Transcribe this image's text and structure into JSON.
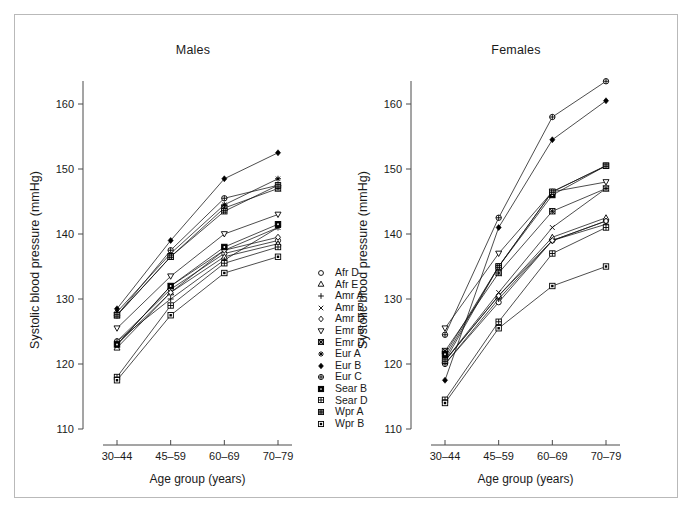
{
  "figure": {
    "border_color": "#b9b9b9",
    "background": "#ffffff",
    "line_color": "#111111"
  },
  "axis": {
    "ylabel": "Systolic blood pressure (mmHg)",
    "xlabel": "Age group (years)",
    "yticks": [
      "110",
      "120",
      "130",
      "140",
      "150",
      "160"
    ],
    "xticks": [
      "30–44",
      "45–59",
      "60–69",
      "70–79"
    ]
  },
  "legend": {
    "entries": [
      {
        "label": "Afr D",
        "symbol": "circle-open"
      },
      {
        "label": "Afr E",
        "symbol": "triangle-open"
      },
      {
        "label": "Amr A",
        "symbol": "plus"
      },
      {
        "label": "Amr B",
        "symbol": "cross"
      },
      {
        "label": "Amr D",
        "symbol": "diamond-open"
      },
      {
        "label": "Emr B",
        "symbol": "triangle-down-open"
      },
      {
        "label": "Emr D",
        "symbol": "square-crosshatch"
      },
      {
        "label": "Eur A",
        "symbol": "asterisk"
      },
      {
        "label": "Eur B",
        "symbol": "diamond-filled"
      },
      {
        "label": "Eur C",
        "symbol": "circle-plus"
      },
      {
        "label": "Sear B",
        "symbol": "square-filled-dot"
      },
      {
        "label": "Sear D",
        "symbol": "square-plus"
      },
      {
        "label": "Wpr A",
        "symbol": "square-hatched"
      },
      {
        "label": "Wpr B",
        "symbol": "square-small-filled"
      }
    ]
  },
  "chart_data": {
    "type": "line",
    "xlabel": "Age group (years)",
    "ylabel": "Systolic blood pressure (mmHg)",
    "categories": [
      "30–44",
      "45–59",
      "60–69",
      "70–79"
    ],
    "ylim": [
      110,
      162
    ],
    "yticks": [
      110,
      120,
      130,
      140,
      150,
      160
    ],
    "grid": false,
    "legend_position": "center",
    "panels": [
      {
        "name": "Males",
        "title": "Males",
        "series": [
          {
            "name": "Afr D",
            "symbol": "circle-open",
            "values": [
              123.5,
              131.5,
              137.0,
              139.0
            ]
          },
          {
            "name": "Afr E",
            "symbol": "triangle-open",
            "values": [
              122.5,
              131.0,
              136.5,
              138.5
            ]
          },
          {
            "name": "Amr A",
            "symbol": "plus",
            "values": [
              123.5,
              130.0,
              136.0,
              141.0
            ]
          },
          {
            "name": "Amr B",
            "symbol": "cross",
            "values": [
              123.0,
              132.0,
              137.5,
              141.0
            ]
          },
          {
            "name": "Amr D",
            "symbol": "diamond-open",
            "values": [
              123.0,
              131.0,
              137.5,
              139.5
            ]
          },
          {
            "name": "Emr B",
            "symbol": "triangle-down-open",
            "values": [
              125.5,
              133.5,
              140.0,
              143.0
            ]
          },
          {
            "name": "Emr D",
            "symbol": "square-crosshatch",
            "values": [
              127.5,
              136.5,
              144.0,
              147.0
            ]
          },
          {
            "name": "Eur A",
            "symbol": "asterisk",
            "values": [
              128.0,
              137.0,
              144.5,
              148.5
            ]
          },
          {
            "name": "Eur B",
            "symbol": "diamond-filled",
            "values": [
              128.5,
              139.0,
              148.5,
              152.5
            ]
          },
          {
            "name": "Eur C",
            "symbol": "circle-plus",
            "values": [
              127.5,
              137.5,
              145.5,
              147.5
            ]
          },
          {
            "name": "Sear B",
            "symbol": "square-filled-dot",
            "values": [
              123.0,
              132.0,
              138.0,
              141.5
            ]
          },
          {
            "name": "Sear D",
            "symbol": "square-plus",
            "values": [
              118.0,
              129.0,
              135.5,
              138.0
            ]
          },
          {
            "name": "Wpr A",
            "symbol": "square-hatched",
            "values": [
              127.5,
              136.5,
              143.5,
              147.5
            ]
          },
          {
            "name": "Wpr B",
            "symbol": "square-small-filled",
            "values": [
              117.5,
              127.5,
              134.0,
              136.5
            ]
          }
        ]
      },
      {
        "name": "Females",
        "title": "Females",
        "series": [
          {
            "name": "Afr D",
            "symbol": "circle-open",
            "values": [
              120.0,
              129.5,
              139.0,
              142.0
            ]
          },
          {
            "name": "Afr E",
            "symbol": "triangle-open",
            "values": [
              120.5,
              130.5,
              139.5,
              142.5
            ]
          },
          {
            "name": "Amr A",
            "symbol": "plus",
            "values": [
              120.0,
              130.0,
              139.0,
              141.5
            ]
          },
          {
            "name": "Amr B",
            "symbol": "cross",
            "values": [
              120.5,
              131.0,
              141.0,
              147.0
            ]
          },
          {
            "name": "Amr D",
            "symbol": "diamond-open",
            "values": [
              120.5,
              130.5,
              139.0,
              142.0
            ]
          },
          {
            "name": "Emr B",
            "symbol": "triangle-down-open",
            "values": [
              125.5,
              137.0,
              146.5,
              148.0
            ]
          },
          {
            "name": "Emr D",
            "symbol": "square-crosshatch",
            "values": [
              122.0,
              134.0,
              143.5,
              147.0
            ]
          },
          {
            "name": "Eur A",
            "symbol": "asterisk",
            "values": [
              121.0,
              135.0,
              146.5,
              150.5
            ]
          },
          {
            "name": "Eur B",
            "symbol": "diamond-filled",
            "values": [
              117.5,
              141.0,
              154.5,
              160.5
            ]
          },
          {
            "name": "Eur C",
            "symbol": "circle-plus",
            "values": [
              124.5,
              142.5,
              158.0,
              163.5
            ]
          },
          {
            "name": "Sear B",
            "symbol": "square-filled-dot",
            "values": [
              121.5,
              135.0,
              146.0,
              150.5
            ]
          },
          {
            "name": "Sear D",
            "symbol": "square-plus",
            "values": [
              114.5,
              126.5,
              137.0,
              141.0
            ]
          },
          {
            "name": "Wpr A",
            "symbol": "square-hatched",
            "values": [
              120.5,
              135.0,
              146.5,
              150.5
            ]
          },
          {
            "name": "Wpr B",
            "symbol": "square-small-filled",
            "values": [
              114.0,
              125.5,
              132.0,
              135.0
            ]
          }
        ]
      }
    ]
  }
}
